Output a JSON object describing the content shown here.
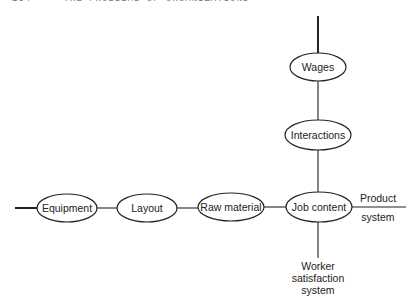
{
  "running_head": {
    "page_number": "154",
    "title": "THE PROBLEMS OF ORGANIZATIONS"
  },
  "diagram": {
    "nodes": [
      {
        "id": "wages",
        "label": "Wages",
        "cx": 318,
        "cy": 67,
        "rx": 28,
        "ry": 14
      },
      {
        "id": "interactions",
        "label": "Interactions",
        "cx": 318,
        "cy": 135,
        "rx": 33,
        "ry": 15
      },
      {
        "id": "equipment",
        "label": "Equipment",
        "cx": 67,
        "cy": 208,
        "rx": 30,
        "ry": 14
      },
      {
        "id": "layout",
        "label": "Layout",
        "cx": 147,
        "cy": 208,
        "rx": 30,
        "ry": 14
      },
      {
        "id": "raw-material",
        "label": "Raw material",
        "cx": 231,
        "cy": 207,
        "rx": 33,
        "ry": 14
      },
      {
        "id": "job-content",
        "label": "Job content",
        "cx": 319,
        "cy": 207,
        "rx": 33,
        "ry": 15
      }
    ],
    "edges": [
      {
        "from": "top",
        "to": "wages"
      },
      {
        "from": "wages",
        "to": "interactions"
      },
      {
        "from": "interactions",
        "to": "job-content"
      },
      {
        "from": "left",
        "to": "equipment"
      },
      {
        "from": "equipment",
        "to": "layout"
      },
      {
        "from": "layout",
        "to": "raw-material"
      },
      {
        "from": "raw-material",
        "to": "job-content"
      },
      {
        "from": "job-content",
        "to": "product-system"
      },
      {
        "from": "job-content",
        "to": "worker-satisfaction-system"
      }
    ],
    "axis_labels": {
      "product_system": [
        "Product",
        "system"
      ],
      "worker_satisfaction_system": [
        "Worker",
        "satisfaction",
        "system"
      ]
    }
  }
}
